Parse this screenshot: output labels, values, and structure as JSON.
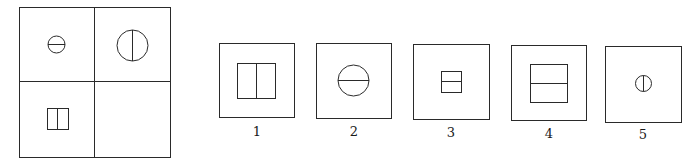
{
  "puzzle": {
    "type": "analogy-matrix",
    "matrix": {
      "rows": 2,
      "cols": 2,
      "cells": [
        {
          "position": "top-left",
          "shape": "circle",
          "size": "small",
          "divider": "horizontal"
        },
        {
          "position": "top-right",
          "shape": "circle",
          "size": "large",
          "divider": "vertical"
        },
        {
          "position": "bottom-left",
          "shape": "rectangle",
          "size": "small",
          "divider": "vertical"
        },
        {
          "position": "bottom-right",
          "shape": "empty",
          "size": "",
          "divider": ""
        }
      ]
    },
    "options": [
      {
        "label": "1",
        "shape": "rectangle",
        "size": "large",
        "divider": "vertical"
      },
      {
        "label": "2",
        "shape": "circle",
        "size": "large",
        "divider": "horizontal"
      },
      {
        "label": "3",
        "shape": "rectangle",
        "size": "small",
        "divider": "horizontal"
      },
      {
        "label": "4",
        "shape": "rectangle",
        "size": "large",
        "divider": "horizontal"
      },
      {
        "label": "5",
        "shape": "circle",
        "size": "small",
        "divider": "vertical"
      }
    ]
  },
  "colors": {
    "line": "#2a2a2a",
    "background": "#ffffff"
  }
}
